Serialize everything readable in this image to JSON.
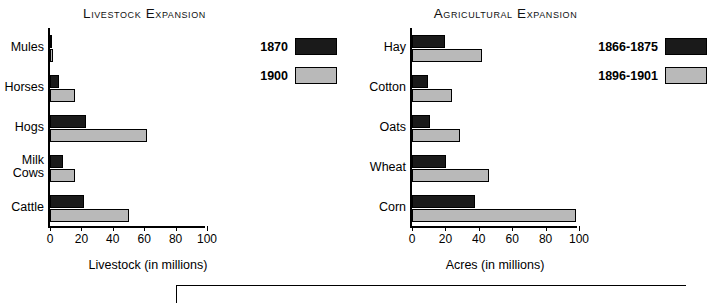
{
  "chart_data": [
    {
      "type": "bar",
      "title": "Livestock Expansion",
      "orientation": "horizontal",
      "xlabel": "Livestock (in millions)",
      "ylabel": "",
      "xlim": [
        0,
        100
      ],
      "xticks": [
        0,
        20,
        40,
        60,
        80,
        100
      ],
      "categories": [
        "Mules",
        "Horses",
        "Hogs",
        "Milk\nCows",
        "Cattle"
      ],
      "grid": false,
      "legend_position": "upper-right",
      "series": [
        {
          "name": "1870",
          "color": "#1a1a1a",
          "values": [
            1.2,
            6.0,
            23.0,
            8.0,
            21.5
          ]
        },
        {
          "name": "1900",
          "color": "#b9b9b9",
          "values": [
            2.0,
            16.0,
            62.0,
            16.0,
            50.0
          ]
        }
      ]
    },
    {
      "type": "bar",
      "title": "Agricultural Expansion",
      "orientation": "horizontal",
      "xlabel": "Acres (in millions)",
      "ylabel": "",
      "xlim": [
        0,
        100
      ],
      "xticks": [
        0,
        20,
        40,
        60,
        80,
        100
      ],
      "categories": [
        "Hay",
        "Cotton",
        "Oats",
        "Wheat",
        "Corn"
      ],
      "grid": false,
      "legend_position": "upper-right",
      "series": [
        {
          "name": "1866-1875",
          "color": "#1a1a1a",
          "values": [
            20.0,
            9.5,
            11.0,
            20.5,
            38.0
          ]
        },
        {
          "name": "1896-1901",
          "color": "#b9b9b9",
          "values": [
            42.0,
            24.0,
            29.0,
            46.0,
            98.0
          ]
        }
      ]
    }
  ],
  "livestock": {
    "title": "Livestock Expansion",
    "axis_caption": "Livestock (in millions)",
    "categories": [
      {
        "label": "Mules"
      },
      {
        "label": "Horses"
      },
      {
        "label": "Hogs"
      },
      {
        "label": "Milk\nCows"
      },
      {
        "label": "Cattle"
      }
    ],
    "ticks": [
      "0",
      "20",
      "40",
      "60",
      "80",
      "100"
    ],
    "legend": [
      {
        "label": "1870",
        "color": "#1a1a1a"
      },
      {
        "label": "1900",
        "color": "#b9b9b9"
      }
    ]
  },
  "agriculture": {
    "title": "Agricultural Expansion",
    "axis_caption": "Acres (in millions)",
    "categories": [
      {
        "label": "Hay"
      },
      {
        "label": "Cotton"
      },
      {
        "label": "Oats"
      },
      {
        "label": "Wheat"
      },
      {
        "label": "Corn"
      }
    ],
    "ticks": [
      "0",
      "20",
      "40",
      "60",
      "80",
      "100"
    ],
    "legend": [
      {
        "label": "1866-1875",
        "color": "#1a1a1a"
      },
      {
        "label": "1896-1901",
        "color": "#b9b9b9"
      }
    ]
  }
}
